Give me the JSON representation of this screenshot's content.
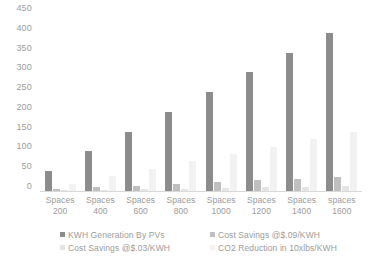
{
  "chart_data": {
    "type": "bar",
    "title": "",
    "xlabel": "",
    "ylabel": "",
    "ylim": [
      0,
      450
    ],
    "grid": false,
    "legend_position": "bottom",
    "categories": [
      "Spaces 200",
      "Spaces 400",
      "Spaces 600",
      "Spaces 800",
      "Spaces 1000",
      "Spaces 1200",
      "Spaces 1400",
      "spaces 1600"
    ],
    "category_lines": [
      {
        "line1": "Spaces",
        "line2": "200"
      },
      {
        "line1": "Spaces",
        "line2": "400"
      },
      {
        "line1": "Spaces",
        "line2": "600"
      },
      {
        "line1": "Spaces",
        "line2": "800"
      },
      {
        "line1": "Spaces",
        "line2": "1000"
      },
      {
        "line1": "Spaces",
        "line2": "1200"
      },
      {
        "line1": "Spaces",
        "line2": "1400"
      },
      {
        "line1": "spaces",
        "line2": "1600"
      }
    ],
    "y_ticks": [
      450,
      400,
      350,
      300,
      250,
      200,
      150,
      100,
      50,
      0
    ],
    "series": [
      {
        "name": "KWH Generation By PVs",
        "color": "#8c8c8c",
        "values": [
          50,
          100,
          150,
          200,
          250,
          300,
          350,
          400
        ]
      },
      {
        "name": "Cost Savings @$.09/KWH",
        "color": "#bfbfbf",
        "values": [
          4.5,
          9,
          13.5,
          18,
          22.5,
          27,
          31.5,
          36
        ]
      },
      {
        "name": "Cost Savings @$.03/KWH",
        "color": "#e4e4e4",
        "values": [
          1.5,
          3,
          4.5,
          6,
          7.5,
          9,
          10.5,
          12
        ]
      },
      {
        "name": "CO2 Reduction in 10xlbs/KWH",
        "color": "#f2f2f2",
        "values": [
          18.75,
          37.5,
          56.25,
          75,
          93.75,
          112.5,
          131.25,
          150
        ]
      }
    ]
  }
}
